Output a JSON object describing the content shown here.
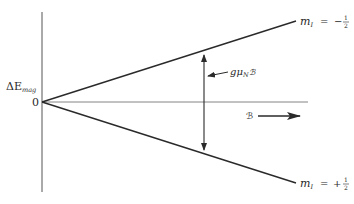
{
  "figure": {
    "type": "energy-level-splitting",
    "y_axis_label": "ΔE",
    "y_axis_label_sub": "mag",
    "origin_label": "0",
    "field_label": "ℬ",
    "gap_label_main": "gμ",
    "gap_label_sub": "N",
    "gap_label_field": "ℬ",
    "upper_level": {
      "label_m": "m",
      "label_sub": "I",
      "label_eq": "=",
      "label_sign": "−",
      "label_num": "1",
      "label_den": "2"
    },
    "lower_level": {
      "label_m": "m",
      "label_sub": "I",
      "label_eq": "=",
      "label_sign": "+",
      "label_num": "1",
      "label_den": "2"
    },
    "colors": {
      "line": "#2a2a2a",
      "axis": "#555555"
    }
  }
}
